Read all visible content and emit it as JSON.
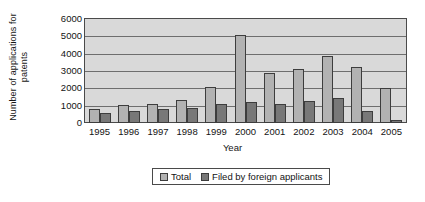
{
  "chart_data": {
    "type": "bar",
    "title": "",
    "xlabel": "Year",
    "ylabel": "Number of applications for\npatents",
    "ylim": [
      0,
      6000
    ],
    "ytick_labels": [
      "6000",
      "5000",
      "4000",
      "3000",
      "2000",
      "1000",
      "0"
    ],
    "ytick_values": [
      6000,
      5000,
      4000,
      3000,
      2000,
      1000,
      0
    ],
    "grid": true,
    "legend_position": "bottom",
    "categories": [
      "1995",
      "1996",
      "1997",
      "1998",
      "1999",
      "2000",
      "2001",
      "2002",
      "2003",
      "2004",
      "2005"
    ],
    "series": [
      {
        "name": "Total",
        "color": "#b2b2b2",
        "values": [
          830,
          1030,
          1100,
          1330,
          2090,
          5080,
          2900,
          3130,
          3890,
          3240,
          2020
        ]
      },
      {
        "name": "Filed by foreign applicants",
        "color": "#787878",
        "values": [
          600,
          720,
          800,
          880,
          1110,
          1230,
          1090,
          1250,
          1440,
          680,
          150
        ]
      }
    ]
  },
  "legend": {
    "items": [
      {
        "label": "Total",
        "swatch": "total"
      },
      {
        "label": "Filed by foreign applicants",
        "swatch": "foreign"
      }
    ]
  },
  "colors": {
    "plot_background": "#d9d9d9",
    "axis": "#4a4a4a",
    "gridline": "#6e6e6e",
    "series_total": "#b2b2b2",
    "series_foreign": "#787878"
  }
}
